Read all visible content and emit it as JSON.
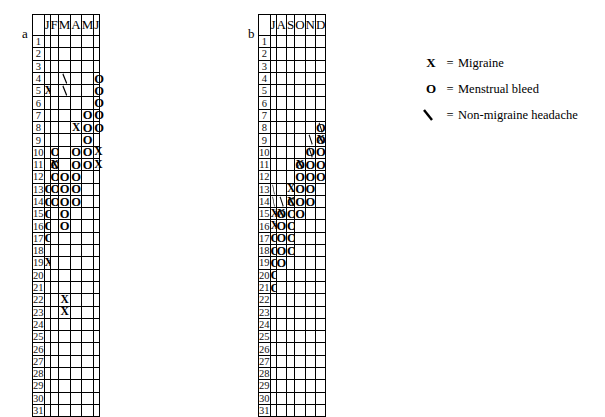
{
  "figure": {
    "panels": [
      {
        "letter": "a",
        "months": [
          "J",
          "F",
          "M",
          "A",
          "M",
          "J"
        ],
        "month_names": [
          "January",
          "February",
          "March",
          "April",
          "May",
          "June"
        ],
        "days": [
          1,
          2,
          3,
          4,
          5,
          6,
          7,
          8,
          9,
          10,
          11,
          12,
          13,
          14,
          15,
          16,
          17,
          18,
          19,
          20,
          21,
          22,
          23,
          24,
          25,
          26,
          27,
          28,
          29,
          30,
          31
        ],
        "marks": [
          {
            "day": 4,
            "col": 2,
            "symbols": [
              "slash"
            ]
          },
          {
            "day": 4,
            "col": 5,
            "symbols": [
              "O"
            ]
          },
          {
            "day": 5,
            "col": 0,
            "symbols": [
              "X"
            ]
          },
          {
            "day": 5,
            "col": 2,
            "symbols": [
              "slash"
            ]
          },
          {
            "day": 5,
            "col": 5,
            "symbols": [
              "O"
            ]
          },
          {
            "day": 6,
            "col": 5,
            "symbols": [
              "O"
            ]
          },
          {
            "day": 7,
            "col": 4,
            "symbols": [
              "O"
            ]
          },
          {
            "day": 7,
            "col": 5,
            "symbols": [
              "O"
            ]
          },
          {
            "day": 8,
            "col": 3,
            "symbols": [
              "X"
            ]
          },
          {
            "day": 8,
            "col": 4,
            "symbols": [
              "O"
            ]
          },
          {
            "day": 8,
            "col": 5,
            "symbols": [
              "O"
            ]
          },
          {
            "day": 9,
            "col": 4,
            "symbols": [
              "O"
            ]
          },
          {
            "day": 10,
            "col": 1,
            "symbols": [
              "O"
            ]
          },
          {
            "day": 10,
            "col": 3,
            "symbols": [
              "O"
            ]
          },
          {
            "day": 10,
            "col": 4,
            "symbols": [
              "O"
            ]
          },
          {
            "day": 10,
            "col": 5,
            "symbols": [
              "X"
            ]
          },
          {
            "day": 11,
            "col": 1,
            "symbols": [
              "O",
              "X"
            ]
          },
          {
            "day": 11,
            "col": 3,
            "symbols": [
              "O"
            ]
          },
          {
            "day": 11,
            "col": 4,
            "symbols": [
              "O"
            ]
          },
          {
            "day": 11,
            "col": 5,
            "symbols": [
              "X"
            ]
          },
          {
            "day": 12,
            "col": 1,
            "symbols": [
              "O"
            ]
          },
          {
            "day": 12,
            "col": 2,
            "symbols": [
              "O"
            ]
          },
          {
            "day": 12,
            "col": 3,
            "symbols": [
              "O"
            ]
          },
          {
            "day": 13,
            "col": 0,
            "symbols": [
              "O"
            ]
          },
          {
            "day": 13,
            "col": 1,
            "symbols": [
              "O"
            ]
          },
          {
            "day": 13,
            "col": 2,
            "symbols": [
              "O"
            ]
          },
          {
            "day": 13,
            "col": 3,
            "symbols": [
              "O"
            ]
          },
          {
            "day": 14,
            "col": 0,
            "symbols": [
              "O"
            ]
          },
          {
            "day": 14,
            "col": 1,
            "symbols": [
              "O"
            ]
          },
          {
            "day": 14,
            "col": 2,
            "symbols": [
              "O"
            ]
          },
          {
            "day": 14,
            "col": 3,
            "symbols": [
              "O"
            ]
          },
          {
            "day": 15,
            "col": 0,
            "symbols": [
              "O"
            ]
          },
          {
            "day": 15,
            "col": 2,
            "symbols": [
              "O"
            ]
          },
          {
            "day": 16,
            "col": 0,
            "symbols": [
              "O"
            ]
          },
          {
            "day": 16,
            "col": 2,
            "symbols": [
              "O"
            ]
          },
          {
            "day": 17,
            "col": 0,
            "symbols": [
              "O"
            ]
          },
          {
            "day": 19,
            "col": 0,
            "symbols": [
              "X"
            ]
          },
          {
            "day": 22,
            "col": 2,
            "symbols": [
              "X"
            ]
          },
          {
            "day": 23,
            "col": 2,
            "symbols": [
              "X"
            ]
          }
        ],
        "blacked": [
          {
            "day": 29,
            "col": 1
          },
          {
            "day": 30,
            "col": 1
          },
          {
            "day": 31,
            "col": 1
          },
          {
            "day": 31,
            "col": 3
          },
          {
            "day": 31,
            "col": 5
          }
        ]
      },
      {
        "letter": "b",
        "months": [
          "J",
          "A",
          "S",
          "O",
          "N",
          "D"
        ],
        "month_names": [
          "July",
          "August",
          "September",
          "October",
          "November",
          "December"
        ],
        "days": [
          1,
          2,
          3,
          4,
          5,
          6,
          7,
          8,
          9,
          10,
          11,
          12,
          13,
          14,
          15,
          16,
          17,
          18,
          19,
          20,
          21,
          22,
          23,
          24,
          25,
          26,
          27,
          28,
          29,
          30,
          31
        ],
        "marks": [
          {
            "day": 8,
            "col": 5,
            "symbols": [
              "O",
              "slash"
            ]
          },
          {
            "day": 9,
            "col": 4,
            "symbols": [
              "slash"
            ]
          },
          {
            "day": 9,
            "col": 5,
            "symbols": [
              "O",
              "X"
            ]
          },
          {
            "day": 10,
            "col": 4,
            "symbols": [
              "O",
              "slash"
            ]
          },
          {
            "day": 10,
            "col": 5,
            "symbols": [
              "O"
            ]
          },
          {
            "day": 11,
            "col": 3,
            "symbols": [
              "O",
              "X"
            ]
          },
          {
            "day": 11,
            "col": 4,
            "symbols": [
              "O"
            ]
          },
          {
            "day": 11,
            "col": 5,
            "symbols": [
              "O"
            ]
          },
          {
            "day": 12,
            "col": 3,
            "symbols": [
              "O"
            ]
          },
          {
            "day": 12,
            "col": 4,
            "symbols": [
              "O"
            ]
          },
          {
            "day": 12,
            "col": 5,
            "symbols": [
              "O"
            ]
          },
          {
            "day": 13,
            "col": 0,
            "symbols": [
              "slash"
            ]
          },
          {
            "day": 13,
            "col": 2,
            "symbols": [
              "X"
            ]
          },
          {
            "day": 13,
            "col": 3,
            "symbols": [
              "O"
            ]
          },
          {
            "day": 13,
            "col": 4,
            "symbols": [
              "O"
            ]
          },
          {
            "day": 14,
            "col": 0,
            "symbols": [
              "slash"
            ]
          },
          {
            "day": 14,
            "col": 1,
            "symbols": [
              "slash"
            ]
          },
          {
            "day": 14,
            "col": 2,
            "symbols": [
              "O",
              "X"
            ]
          },
          {
            "day": 14,
            "col": 3,
            "symbols": [
              "O"
            ]
          },
          {
            "day": 14,
            "col": 4,
            "symbols": [
              "O"
            ]
          },
          {
            "day": 15,
            "col": 0,
            "symbols": [
              "X"
            ]
          },
          {
            "day": 15,
            "col": 1,
            "symbols": [
              "O",
              "X"
            ]
          },
          {
            "day": 15,
            "col": 2,
            "symbols": [
              "O"
            ]
          },
          {
            "day": 15,
            "col": 3,
            "symbols": [
              "O"
            ]
          },
          {
            "day": 16,
            "col": 0,
            "symbols": [
              "X"
            ]
          },
          {
            "day": 16,
            "col": 1,
            "symbols": [
              "O"
            ]
          },
          {
            "day": 16,
            "col": 2,
            "symbols": [
              "O"
            ]
          },
          {
            "day": 17,
            "col": 0,
            "symbols": [
              "O"
            ]
          },
          {
            "day": 17,
            "col": 1,
            "symbols": [
              "O"
            ]
          },
          {
            "day": 17,
            "col": 2,
            "symbols": [
              "O"
            ]
          },
          {
            "day": 18,
            "col": 0,
            "symbols": [
              "O"
            ]
          },
          {
            "day": 18,
            "col": 1,
            "symbols": [
              "O"
            ]
          },
          {
            "day": 18,
            "col": 2,
            "symbols": [
              "O"
            ]
          },
          {
            "day": 19,
            "col": 0,
            "symbols": [
              "O"
            ]
          },
          {
            "day": 19,
            "col": 1,
            "symbols": [
              "O"
            ]
          },
          {
            "day": 20,
            "col": 0,
            "symbols": [
              "O"
            ]
          },
          {
            "day": 21,
            "col": 0,
            "symbols": [
              "O"
            ]
          }
        ],
        "blacked": [
          {
            "day": 31,
            "col": 2
          },
          {
            "day": 31,
            "col": 4
          }
        ]
      }
    ],
    "legend": [
      {
        "symbol": "X",
        "equals": "=",
        "label": "Migraine"
      },
      {
        "symbol": "O",
        "equals": "=",
        "label": "Menstrual bleed"
      },
      {
        "symbol": "slash",
        "equals": "=",
        "label": "Non-migraine headache"
      }
    ]
  }
}
